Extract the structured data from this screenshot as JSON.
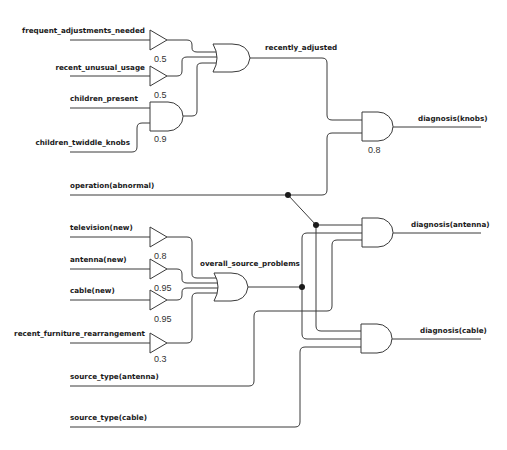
{
  "diagram": {
    "type": "belief-network-logic-circuit",
    "inputs": [
      {
        "id": "frequent_adjustments_needed",
        "label": "frequent_adjustments_needed"
      },
      {
        "id": "recent_unusual_usage",
        "label": "recent_unusual_usage"
      },
      {
        "id": "children_present",
        "label": "children_present"
      },
      {
        "id": "children_twiddle_knobs",
        "label": "children_twiddle_knobs"
      },
      {
        "id": "operation_abnormal",
        "label": "operation(abnormal)"
      },
      {
        "id": "television_new",
        "label": "television(new)"
      },
      {
        "id": "antenna_new",
        "label": "antenna(new)"
      },
      {
        "id": "cable_new",
        "label": "cable(new)"
      },
      {
        "id": "recent_furniture_rearrangement",
        "label": "recent_furniture_rearrangement"
      },
      {
        "id": "source_type_antenna",
        "label": "source_type(antenna)"
      },
      {
        "id": "source_type_cable",
        "label": "source_type(cable)"
      }
    ],
    "buffers": [
      {
        "id": "buf_frequent",
        "input": "frequent_adjustments_needed",
        "prob": "0.5"
      },
      {
        "id": "buf_unusual",
        "input": "recent_unusual_usage",
        "prob": "0.5"
      },
      {
        "id": "buf_tv",
        "input": "television(new)",
        "prob": "0.8"
      },
      {
        "id": "buf_antenna",
        "input": "antenna(new)",
        "prob": "0.95"
      },
      {
        "id": "buf_cable",
        "input": "cable(new)",
        "prob": "0.95"
      },
      {
        "id": "buf_furniture",
        "input": "recent_furniture_rearrangement",
        "prob": "0.3"
      }
    ],
    "gates": [
      {
        "id": "and_children",
        "type": "AND",
        "inputs": [
          "children_present",
          "children_twiddle_knobs"
        ],
        "prob": "0.9"
      },
      {
        "id": "or_recently_adjusted",
        "type": "OR",
        "inputs": [
          "buf_frequent",
          "buf_unusual",
          "and_children"
        ],
        "output_label": "recently_adjusted"
      },
      {
        "id": "or_source",
        "type": "OR",
        "inputs": [
          "buf_tv",
          "buf_antenna",
          "buf_cable",
          "buf_furniture"
        ],
        "output_label": "overall_source_problems"
      },
      {
        "id": "and_knobs",
        "type": "AND",
        "inputs": [
          "recently_adjusted",
          "operation(abnormal)"
        ],
        "prob": "0.8",
        "output_label": "diagnosis(knobs)"
      },
      {
        "id": "and_antenna",
        "type": "AND",
        "inputs": [
          "operation(abnormal)",
          "overall_source_problems",
          "source_type(antenna)"
        ],
        "output_label": "diagnosis(antenna)"
      },
      {
        "id": "and_cable",
        "type": "AND",
        "inputs": [
          "operation(abnormal)",
          "overall_source_problems",
          "source_type(cable)"
        ],
        "output_label": "diagnosis(cable)"
      }
    ],
    "intermediate_labels": {
      "recently_adjusted": "recently_adjusted",
      "overall_source_problems": "overall_source_problems"
    },
    "outputs": {
      "knobs": "diagnosis(knobs)",
      "antenna": "diagnosis(antenna)",
      "cable": "diagnosis(cable)"
    },
    "colors": {
      "wire": "#3a3a3a",
      "junction": "#1a1a1a",
      "background": "#ffffff"
    }
  }
}
